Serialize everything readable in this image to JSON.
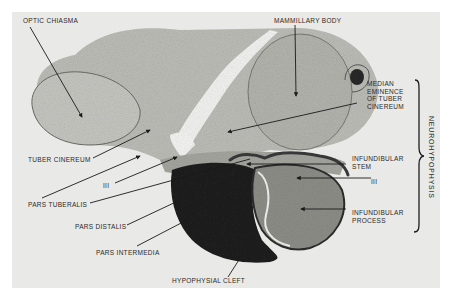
{
  "figure": {
    "labels": {
      "optic_chiasma": "OPTIC CHIASMA",
      "mammillary_body": "MAMMILLARY BODY",
      "median_eminence": "MEDIAN\nEMINENCE\nOF TUBER\nCINEREUM",
      "tuber_cinereum": "TUBER CINEREUM",
      "third_ventricle_left": "III",
      "pars_tuberalis": "PARS TUBERALIS",
      "pars_distalis": "PARS DISTALIS",
      "pars_intermedia": "PARS INTERMEDIA",
      "hypophysial_cleft": "HYPOPHYSIAL CLEFT",
      "infundibular_stem": "INFUNDIBULAR\nSTEM",
      "third_ventricle_right": "III",
      "infundibular_process": "INFUNDIBULAR\nPROCESS",
      "neurohypophysis": "NEUROHYPOPHYSIS"
    },
    "colors": {
      "background": "#e9e9e7",
      "tissue_light": "#c9c9c5",
      "tissue_mid": "#a9a9a4",
      "tissue_dark": "#1e1e1e",
      "label_text": "#2a2a2a"
    }
  }
}
